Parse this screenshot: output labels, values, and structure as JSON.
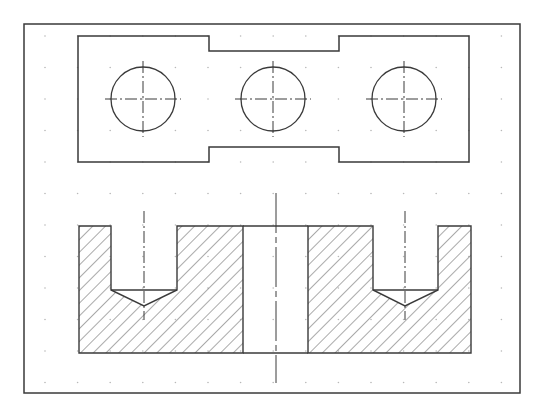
{
  "drawing": {
    "title": "Plate with three holes — top view and sectional front view",
    "colors": {
      "background": "#ffffff",
      "line": "#3a3a3a",
      "grid_dot": "#b8b8b8",
      "hatch": "#555555"
    },
    "frame": {
      "x": 24,
      "y": 24,
      "w": 496,
      "h": 369
    },
    "grid": {
      "x0": 45,
      "y0": 36,
      "dx": 32.6,
      "dy": 31.5,
      "cols": 15,
      "rows": 12
    },
    "top_view": {
      "outline_points": "78,36 209,36 209,51 339,51 339,36 469,36 469,162 339,162 339,147 209,147 209,162 78,162",
      "holes": [
        {
          "cx": 143,
          "cy": 99,
          "r": 32
        },
        {
          "cx": 273,
          "cy": 99,
          "r": 32
        },
        {
          "cx": 404,
          "cy": 99,
          "r": 32
        }
      ]
    },
    "section_view": {
      "x": 79,
      "y": 226,
      "w": 392,
      "h": 127,
      "through_hole": {
        "x1": 243,
        "x2": 308
      },
      "blind_holes": [
        {
          "x1": 111,
          "x2": 177,
          "flat_y": 290,
          "tip_y": 306,
          "axis_x": 144
        },
        {
          "x1": 373,
          "x2": 438,
          "flat_y": 290,
          "tip_y": 306,
          "axis_x": 405
        }
      ],
      "center_axis_x": 276
    }
  }
}
